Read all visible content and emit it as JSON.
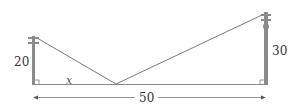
{
  "diagram": {
    "title": "",
    "left_pole": {
      "height_label": "20"
    },
    "right_pole": {
      "height_label": "30"
    },
    "ground": {
      "distance_label": "50",
      "variable_label": "x"
    },
    "colors": {
      "pole": "#8a8a8a",
      "wire": "#7a7a7a",
      "ground": "#8a8a8a",
      "text": "#333333"
    }
  }
}
